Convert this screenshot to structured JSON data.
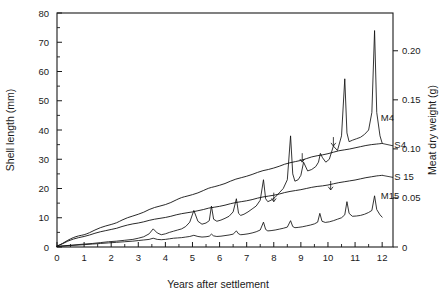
{
  "chart_data": {
    "type": "line",
    "title": "",
    "subtitle": "",
    "xlabel": "Years after settlement",
    "ylabel": "Shell length (mm)",
    "y2label": "Meat dry weight (g)",
    "xlim": [
      0,
      12.4
    ],
    "ylim": [
      0,
      80
    ],
    "y2lim": [
      0,
      0.2385
    ],
    "grid": false,
    "legend_position": "inline-right-end-labels",
    "x_ticks_major": [
      0,
      1,
      2,
      3,
      4,
      5,
      6,
      7,
      8,
      9,
      10,
      11,
      12
    ],
    "x_tick_labels": [
      "0",
      "1",
      "2",
      "3",
      "4",
      "5",
      "6",
      "7",
      "8",
      "9",
      "10",
      "11",
      "12"
    ],
    "x_ticks_minor_step": 0.5,
    "y_ticks_major": [
      0,
      10,
      20,
      30,
      40,
      50,
      60,
      70,
      80
    ],
    "y_tick_labels": [
      "0",
      "10",
      "20",
      "30",
      "40",
      "50",
      "60",
      "70",
      "80"
    ],
    "y_ticks_minor": [
      5,
      15,
      25,
      35,
      45,
      55,
      65,
      75
    ],
    "y2_ticks_major": [
      0,
      0.05,
      0.1,
      0.15,
      0.2
    ],
    "y2_tick_labels": [
      "0",
      "0.05",
      "0.10",
      "0.15",
      "0.20"
    ],
    "annotations": [
      {
        "name": "arrow-m4-year9",
        "x": 9.05,
        "y": 29.0
      },
      {
        "name": "arrow-m4-year10",
        "x": 10.2,
        "y": 34.5
      },
      {
        "name": "arrow-m15-year8",
        "x": 8.0,
        "y": 15.5
      },
      {
        "name": "arrow-m15-year10",
        "x": 10.1,
        "y": 19.5
      }
    ],
    "series": [
      {
        "name": "S4",
        "label": "S4",
        "axis": "left",
        "units": "mm",
        "style": "smooth",
        "label_x": 12.45,
        "label_y": 34.0,
        "x": [
          0,
          0.2,
          0.4,
          0.6,
          0.8,
          1.0,
          1.2,
          1.4,
          1.6,
          1.8,
          2.0,
          2.2,
          2.4,
          2.6,
          2.8,
          3.0,
          3.2,
          3.4,
          3.6,
          3.8,
          4.0,
          4.2,
          4.4,
          4.6,
          4.8,
          5.0,
          5.2,
          5.4,
          5.6,
          5.8,
          6.0,
          6.2,
          6.4,
          6.6,
          6.8,
          7.0,
          7.2,
          7.4,
          7.6,
          7.8,
          8.0,
          8.2,
          8.4,
          8.6,
          8.8,
          9.0,
          9.2,
          9.4,
          9.6,
          9.8,
          10.0,
          10.2,
          10.4,
          10.6,
          10.8,
          11.0,
          11.2,
          11.4,
          11.6,
          11.8,
          12.0
        ],
        "values": [
          0.3,
          1.2,
          2.3,
          3.2,
          3.8,
          4.2,
          4.9,
          5.8,
          6.6,
          7.2,
          7.7,
          8.3,
          9.2,
          10.0,
          10.6,
          11.2,
          11.9,
          12.8,
          13.5,
          14.0,
          14.5,
          15.2,
          16.1,
          16.9,
          17.4,
          17.9,
          18.5,
          19.3,
          20.1,
          20.6,
          21.1,
          21.7,
          22.5,
          23.2,
          23.7,
          24.2,
          24.8,
          25.5,
          26.1,
          26.5,
          27.0,
          27.6,
          28.3,
          28.8,
          29.2,
          29.6,
          30.2,
          30.8,
          31.2,
          31.5,
          31.9,
          32.4,
          32.9,
          33.2,
          33.5,
          33.9,
          34.3,
          34.7,
          35.0,
          35.2,
          35.4
        ]
      },
      {
        "name": "S15",
        "label": "S 15",
        "axis": "left",
        "units": "mm",
        "style": "smooth",
        "label_x": 12.45,
        "label_y": 23.0,
        "x": [
          0,
          0.2,
          0.4,
          0.6,
          0.8,
          1.0,
          1.2,
          1.4,
          1.6,
          1.8,
          2.0,
          2.2,
          2.4,
          2.6,
          2.8,
          3.0,
          3.2,
          3.4,
          3.6,
          3.8,
          4.0,
          4.2,
          4.4,
          4.6,
          4.8,
          5.0,
          5.2,
          5.4,
          5.6,
          5.8,
          6.0,
          6.2,
          6.4,
          6.6,
          6.8,
          7.0,
          7.2,
          7.4,
          7.6,
          7.8,
          8.0,
          8.2,
          8.4,
          8.6,
          8.8,
          9.0,
          9.2,
          9.4,
          9.6,
          9.8,
          10.0,
          10.2,
          10.4,
          10.6,
          10.8,
          11.0,
          11.2,
          11.4,
          11.6,
          11.8,
          12.0
        ],
        "values": [
          0.3,
          1.1,
          2.0,
          2.7,
          3.2,
          3.6,
          4.1,
          4.7,
          5.2,
          5.6,
          6.0,
          6.4,
          7.0,
          7.5,
          7.9,
          8.2,
          8.6,
          9.1,
          9.5,
          9.8,
          10.1,
          10.5,
          11.0,
          11.4,
          11.7,
          12.0,
          12.4,
          12.8,
          13.3,
          13.6,
          13.9,
          14.3,
          14.8,
          15.2,
          15.5,
          15.8,
          16.2,
          16.7,
          17.1,
          17.4,
          17.7,
          18.1,
          18.6,
          19.0,
          19.3,
          19.6,
          20.0,
          20.4,
          20.7,
          20.9,
          21.2,
          21.6,
          22.0,
          22.3,
          22.6,
          22.9,
          23.3,
          23.7,
          24.0,
          24.3,
          24.5
        ]
      },
      {
        "name": "M4",
        "label": "M4",
        "axis": "right",
        "units": "g",
        "style": "sawtooth",
        "label_x": 11.95,
        "label_y": 43.0,
        "x": [
          0,
          0.5,
          1.0,
          1.3,
          1.6,
          1.9,
          2.2,
          2.5,
          2.8,
          3.0,
          3.2,
          3.4,
          3.55,
          3.7,
          3.85,
          4.0,
          4.15,
          4.3,
          4.45,
          4.6,
          4.75,
          4.9,
          5.05,
          5.2,
          5.35,
          5.5,
          5.62,
          5.7,
          5.78,
          5.9,
          6.05,
          6.2,
          6.35,
          6.5,
          6.62,
          6.7,
          6.78,
          6.9,
          7.05,
          7.2,
          7.35,
          7.5,
          7.62,
          7.7,
          7.78,
          7.9,
          8.05,
          8.2,
          8.35,
          8.5,
          8.62,
          8.7,
          8.78,
          8.9,
          9.0,
          9.1,
          9.25,
          9.4,
          9.55,
          9.65,
          9.72,
          9.8,
          9.92,
          10.05,
          10.2,
          10.35,
          10.5,
          10.62,
          10.7,
          10.78,
          10.9,
          11.05,
          11.2,
          11.35,
          11.5,
          11.62,
          11.72,
          11.8,
          11.92,
          12.0
        ],
        "values": [
          0.2,
          0.6,
          1.0,
          1.2,
          1.5,
          1.8,
          2.0,
          2.3,
          2.6,
          3.0,
          3.5,
          4.5,
          6.2,
          4.8,
          4.2,
          4.5,
          5.0,
          5.4,
          5.8,
          6.2,
          7.0,
          8.5,
          12.5,
          8.8,
          7.8,
          8.2,
          9.0,
          14.0,
          9.5,
          8.8,
          9.2,
          9.8,
          10.5,
          12.0,
          16.5,
          11.5,
          10.8,
          11.2,
          12.0,
          13.0,
          14.0,
          16.0,
          23.0,
          16.5,
          15.5,
          16.0,
          17.0,
          18.5,
          20.0,
          23.0,
          38.0,
          25.0,
          22.5,
          23.0,
          24.5,
          29.0,
          26.0,
          26.5,
          27.5,
          29.0,
          32.0,
          30.5,
          29.0,
          30.0,
          34.5,
          33.0,
          38.0,
          57.5,
          39.0,
          36.0,
          36.5,
          37.0,
          37.5,
          38.5,
          40.0,
          46.0,
          74.0,
          46.0,
          38.0,
          35.5
        ]
      },
      {
        "name": "M15",
        "label": "M15",
        "axis": "right",
        "units": "g",
        "style": "sawtooth",
        "label_x": 11.95,
        "label_y": 16.5,
        "x": [
          0,
          0.5,
          1.0,
          1.3,
          1.6,
          1.9,
          2.2,
          2.5,
          2.8,
          3.0,
          3.2,
          3.4,
          3.55,
          3.7,
          3.85,
          4.0,
          4.15,
          4.3,
          4.45,
          4.6,
          4.75,
          4.9,
          5.05,
          5.2,
          5.35,
          5.5,
          5.62,
          5.7,
          5.78,
          5.9,
          6.05,
          6.2,
          6.35,
          6.5,
          6.62,
          6.7,
          6.78,
          6.9,
          7.05,
          7.2,
          7.35,
          7.5,
          7.62,
          7.7,
          7.78,
          7.9,
          8.05,
          8.2,
          8.35,
          8.5,
          8.62,
          8.7,
          8.78,
          8.9,
          9.05,
          9.2,
          9.35,
          9.5,
          9.62,
          9.7,
          9.78,
          9.9,
          10.05,
          10.2,
          10.35,
          10.5,
          10.62,
          10.7,
          10.78,
          10.9,
          11.05,
          11.2,
          11.35,
          11.5,
          11.62,
          11.72,
          11.8,
          11.92,
          12.0
        ],
        "values": [
          0.2,
          0.5,
          0.8,
          1.0,
          1.2,
          1.4,
          1.6,
          1.8,
          2.0,
          2.2,
          2.4,
          2.6,
          3.0,
          2.6,
          2.5,
          2.6,
          2.8,
          3.0,
          3.1,
          3.2,
          3.4,
          3.6,
          4.0,
          3.6,
          3.4,
          3.5,
          3.7,
          4.4,
          3.8,
          3.6,
          3.7,
          3.9,
          4.1,
          4.4,
          5.5,
          4.5,
          4.2,
          4.3,
          4.5,
          4.8,
          5.2,
          5.8,
          8.5,
          6.0,
          5.5,
          5.6,
          5.8,
          6.1,
          6.4,
          6.8,
          9.0,
          7.0,
          6.6,
          6.7,
          6.9,
          7.2,
          7.5,
          7.9,
          8.5,
          11.5,
          8.8,
          8.4,
          8.6,
          9.0,
          9.5,
          10.0,
          11.0,
          15.5,
          11.5,
          10.5,
          10.6,
          10.8,
          11.2,
          11.8,
          12.5,
          17.5,
          12.8,
          11.0,
          10.2
        ]
      }
    ]
  }
}
